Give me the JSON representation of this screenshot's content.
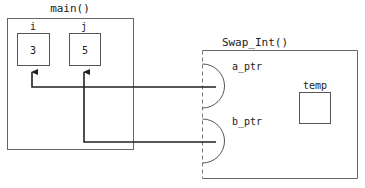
{
  "main": {
    "title": "main()",
    "vars": [
      {
        "name": "i",
        "value": "3"
      },
      {
        "name": "j",
        "value": "5"
      }
    ]
  },
  "swap": {
    "title": "Swap_Int()",
    "params": [
      {
        "name": "a_ptr",
        "points_to": "i"
      },
      {
        "name": "b_ptr",
        "points_to": "j"
      }
    ],
    "local": {
      "name": "temp",
      "value": ""
    }
  },
  "colors": {
    "frame": "#555555",
    "arrow": "#222222"
  }
}
